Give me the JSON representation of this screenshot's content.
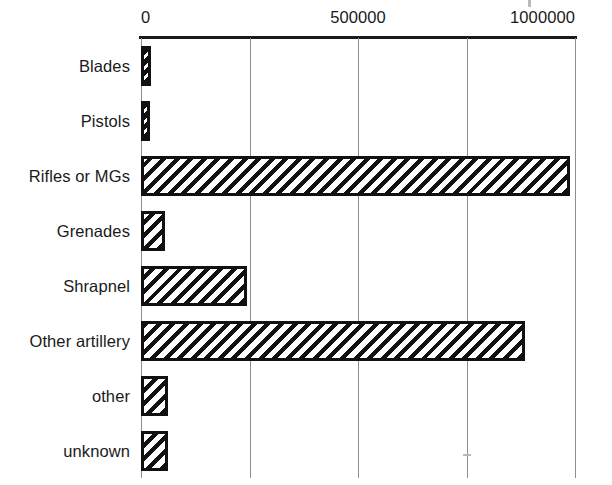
{
  "chart_data": {
    "type": "bar",
    "orientation": "horizontal",
    "title": "",
    "subtitle": "",
    "xlabel": "",
    "ylabel": "",
    "categories": [
      "Blades",
      "Pistols",
      "Rifles or MGs",
      "Grenades",
      "Shrapnel",
      "Other artillery",
      "other",
      "unknown"
    ],
    "values": [
      22000,
      18000,
      988000,
      55000,
      244000,
      885000,
      62000,
      62000
    ],
    "xlim": [
      0,
      1000000
    ],
    "xticks": [
      0,
      250000,
      500000,
      750000,
      1000000
    ],
    "xtick_labels": [
      "0",
      "",
      "500000",
      "",
      "1000000"
    ],
    "xtick_labels_visible": [
      "0",
      "500000",
      "1000000"
    ],
    "grid": true,
    "grid_axis": "x",
    "legend": false,
    "legend_position": "none",
    "axis_position": "top",
    "bar_fill": "diagonal-hatch",
    "bar_edge_color": "#111111",
    "bar_fill_color": "#ffffff",
    "grid_color": "#8d8d8d",
    "axis_color": "#1a1a1a",
    "background_color": "#ffffff"
  },
  "axis": {
    "ticks": [
      {
        "label": "0",
        "value": 0,
        "align": "start"
      },
      {
        "label": "500000",
        "value": 500000,
        "align": "mid"
      },
      {
        "label": "1000000",
        "value": 1000000,
        "align": "end"
      }
    ]
  },
  "bars": [
    {
      "label": "Blades",
      "value": 22000,
      "thin": true
    },
    {
      "label": "Pistols",
      "value": 18000,
      "thin": true
    },
    {
      "label": "Rifles or MGs",
      "value": 988000,
      "thin": false
    },
    {
      "label": "Grenades",
      "value": 55000,
      "thin": false
    },
    {
      "label": "Shrapnel",
      "value": 244000,
      "thin": false
    },
    {
      "label": "Other artillery",
      "value": 885000,
      "thin": false
    },
    {
      "label": "other",
      "value": 62000,
      "thin": false
    },
    {
      "label": "unknown",
      "value": 62000,
      "thin": false
    }
  ]
}
